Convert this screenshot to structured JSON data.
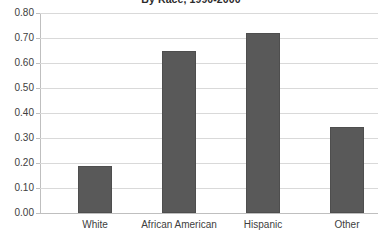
{
  "chart_data": {
    "type": "bar",
    "title": "By Race, 1990-2000",
    "xlabel": "",
    "ylabel": "",
    "categories": [
      "White",
      "African American",
      "Hispanic",
      "Other"
    ],
    "values": [
      0.19,
      0.65,
      0.72,
      0.345
    ],
    "ylim": [
      0.0,
      0.8
    ],
    "ytick_step": 0.1,
    "ytick_labels": [
      "0.80",
      "0.70",
      "0.60",
      "0.50",
      "0.40",
      "0.30",
      "0.20",
      "0.10",
      "0.00"
    ],
    "grid": true,
    "legend": false,
    "legend_position": "none",
    "series": [
      {
        "name": "Rate",
        "values": [
          0.19,
          0.65,
          0.72,
          0.345
        ],
        "color": "#595959"
      }
    ],
    "colors": {
      "bar_fill": "#595959",
      "bar_border": "#4e4e4e",
      "gridline": "#d9d9d9",
      "axis_line": "#bfbfbf",
      "text": "#404040",
      "title_text": "#2b2b2b",
      "background": "#ffffff"
    }
  }
}
